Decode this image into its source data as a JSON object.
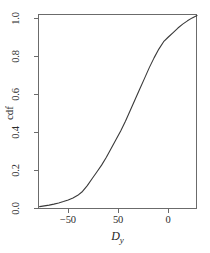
{
  "chart_data": {
    "type": "line",
    "title": "",
    "subtitle": "",
    "xlabel": "D",
    "xlabel_subscript": "y",
    "ylabel": "cdf",
    "grid": false,
    "legend": false,
    "legend_position": "none",
    "line_color": "#3a3a3a",
    "frame_color": "#6b6b6b",
    "background_color": "#ffffff",
    "xlim": [
      -75,
      25
    ],
    "ylim": [
      0.0,
      1.0
    ],
    "xticks": [
      -50,
      50,
      0
    ],
    "xtick_labels": [
      "−50",
      "50",
      "0"
    ],
    "xtick_positions_px": [
      68,
      118,
      168
    ],
    "yticks": [
      0.0,
      0.2,
      0.4,
      0.6,
      0.8,
      1.0
    ],
    "ytick_labels": [
      "0.0",
      "0.2",
      "0.4",
      "0.6",
      "0.8",
      "1.0"
    ],
    "series": [
      {
        "name": "empirical cdf",
        "x": [
          -74,
          -71,
          -68,
          -65,
          -62,
          -59,
          -56,
          -53,
          -50,
          -47,
          -44,
          -41,
          -38,
          -35,
          -32,
          -29,
          -26,
          -23,
          -20,
          -17,
          -14,
          -11,
          -8,
          -5,
          -2,
          1,
          4,
          7,
          10,
          13,
          16,
          19,
          22,
          25
        ],
        "y": [
          0.012,
          0.016,
          0.02,
          0.025,
          0.031,
          0.038,
          0.046,
          0.056,
          0.07,
          0.09,
          0.12,
          0.155,
          0.19,
          0.225,
          0.265,
          0.31,
          0.355,
          0.4,
          0.45,
          0.505,
          0.56,
          0.615,
          0.67,
          0.725,
          0.775,
          0.82,
          0.858,
          0.882,
          0.905,
          0.928,
          0.948,
          0.965,
          0.98,
          0.992
        ]
      }
    ],
    "annotations": []
  },
  "axis": {
    "x_title_main": "D",
    "x_title_sub": "y",
    "y_title": "cdf"
  }
}
